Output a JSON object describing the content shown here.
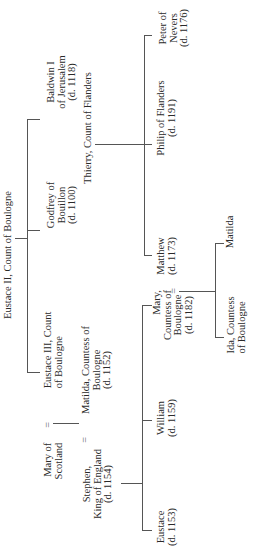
{
  "diagram": {
    "type": "genealogy-tree",
    "orientation": "rotated-90-ccw",
    "marriage_symbol": "=",
    "line_color": "#555555",
    "text_color": "#2a2a2a",
    "people": {
      "eustace_ii": [
        "Eustace II, Count of Boulogne"
      ],
      "godfrey": [
        "Godfrey of",
        "Bouillon",
        "(d. 1100)"
      ],
      "baldwin": [
        "Baldwin I",
        "of Jerusalem",
        "(d. 1118)"
      ],
      "mary_scotland": [
        "Mary of",
        "Scotland"
      ],
      "eustace_iii": [
        "Eustace III, Count",
        "of Boulogne"
      ],
      "stephen": [
        "Stephen,",
        "King of England",
        "(d. 1154)"
      ],
      "matilda_countess": [
        "Matilda, Countess of",
        "Boulogne",
        "(d. 1152)"
      ],
      "eustace": [
        "Eustace",
        "(d. 1153)"
      ],
      "william": [
        "William",
        "(d. 1159)"
      ],
      "mary_countess": [
        "Mary,",
        "Countess of",
        "Boulogne",
        "(d. 1182)"
      ],
      "thierry": [
        "Thierry, Count of Flanders"
      ],
      "matthew": [
        "Matthew",
        "(d. 1173)"
      ],
      "philip": [
        "Philip of Flanders",
        "(d. 1191)"
      ],
      "peter": [
        "Peter of",
        "Nevers",
        "(d. 1176)"
      ],
      "ida": [
        "Ida, Countess",
        "of Boulogne"
      ],
      "matilda": [
        "Matilda"
      ]
    },
    "marriages": [
      [
        "Mary of Scotland",
        "Eustace III, Count of Boulogne"
      ],
      [
        "Stephen, King of England",
        "Matilda, Countess of Boulogne"
      ],
      [
        "Mary, Countess of Boulogne",
        "Matthew"
      ]
    ],
    "descent": [
      {
        "parents": "Eustace II, Count of Boulogne",
        "children": [
          "Eustace III, Count of Boulogne",
          "Godfrey of Bouillon",
          "Baldwin I of Jerusalem"
        ]
      },
      {
        "parents": "Mary of Scotland = Eustace III",
        "children": [
          "Matilda, Countess of Boulogne"
        ]
      },
      {
        "parents": "Stephen = Matilda",
        "children": [
          "Eustace",
          "William",
          "Mary, Countess of Boulogne"
        ]
      },
      {
        "parents": "Thierry, Count of Flanders",
        "children": [
          "Matthew",
          "Philip of Flanders",
          "Peter of Nevers"
        ]
      },
      {
        "parents": "Mary = Matthew",
        "children": [
          "Ida, Countess of Boulogne",
          "Matilda"
        ]
      }
    ]
  }
}
